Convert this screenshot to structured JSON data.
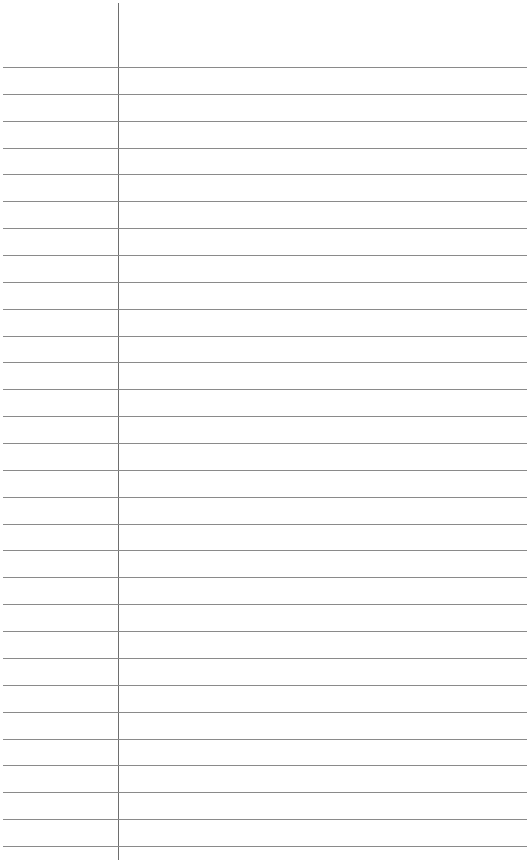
{
  "page": {
    "type": "lined-paper",
    "background_color": "#ffffff",
    "rule_color": "#8a8a8a",
    "margin_color": "#6e6e6e",
    "rule_count": 30,
    "first_rule_y": 67,
    "rule_spacing": 26.86,
    "margin_x": 118
  }
}
